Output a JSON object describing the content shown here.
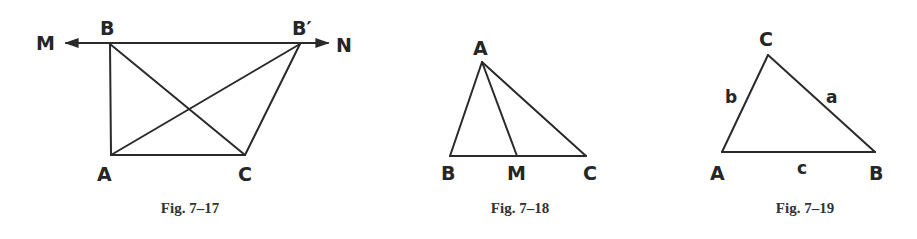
{
  "figures": [
    {
      "caption": "Fig. 7–17",
      "points": {
        "M": "M",
        "B": "B",
        "B_prime": "B′",
        "N": "N",
        "A": "A",
        "C": "C"
      },
      "description": "Line MN through B and B′ parallel to AC; triangles ABC and AB′C share base AC"
    },
    {
      "caption": "Fig. 7–18",
      "points": {
        "A": "A",
        "B": "B",
        "M": "M",
        "C": "C"
      },
      "description": "Triangle ABC with segment AM from A to point M on BC"
    },
    {
      "caption": "Fig. 7–19",
      "points": {
        "C": "C",
        "A": "A",
        "B": "B"
      },
      "sides": {
        "a": "a",
        "b": "b",
        "c": "c"
      },
      "description": "Triangle ABC with sides a, b, c opposite vertices A, B, C"
    }
  ],
  "colors": {
    "ink": "#2a2a2a",
    "background": "#ffffff"
  }
}
